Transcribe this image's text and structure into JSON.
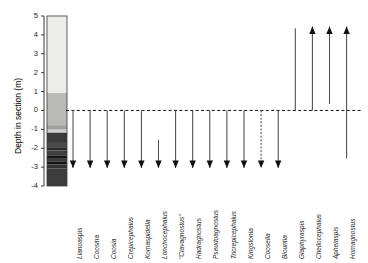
{
  "chart_data": {
    "type": "range-chart",
    "title": "",
    "ylabel": "Depth in section (m)",
    "xlabel": "",
    "ylim": [
      -4,
      5
    ],
    "yticks": [
      5,
      4,
      3,
      2,
      1,
      0,
      -1,
      -2,
      -3,
      -4
    ],
    "ytick_labels": [
      "5",
      "4",
      "3",
      "2",
      "1",
      "0",
      "-1",
      "-2",
      "-3",
      "-4"
    ],
    "datum_line": {
      "value": 0,
      "style": "dashed",
      "color": "#111111"
    },
    "grid": false,
    "legend": null,
    "lithology_column": {
      "x_range": [
        -4.1,
        5
      ],
      "bands": [
        {
          "top": 5.0,
          "bottom": 0.92,
          "color": "#ececea"
        },
        {
          "top": 0.92,
          "bottom": -0.78,
          "color": "#b9b9b7"
        },
        {
          "top": -0.78,
          "bottom": -1.02,
          "color": "#a0a09e"
        },
        {
          "top": -1.02,
          "bottom": -1.18,
          "color": "#cfcfcd"
        },
        {
          "top": -1.18,
          "bottom": -1.72,
          "color": "#3b3b3b"
        },
        {
          "top": -1.72,
          "bottom": -1.95,
          "color": "#4a4a4a"
        },
        {
          "top": -1.95,
          "bottom": -2.12,
          "color": "#2a2a2a"
        },
        {
          "top": -2.12,
          "bottom": -2.38,
          "color": "#3f3f3f"
        },
        {
          "top": -2.38,
          "bottom": -2.52,
          "color": "#161616"
        },
        {
          "top": -2.52,
          "bottom": -2.72,
          "color": "#3a3a3a"
        },
        {
          "top": -2.72,
          "bottom": -2.86,
          "color": "#141414"
        },
        {
          "top": -2.86,
          "bottom": -3.08,
          "color": "#333333"
        },
        {
          "top": -3.08,
          "bottom": -4.0,
          "color": "#3c3c3c"
        }
      ]
    },
    "categories": [
      "Llanoaspis",
      "Coosina",
      "Coosia",
      "Crepicephalus",
      "Komaspidella",
      "Lonchocephalus",
      "\"Clavagnostus\"",
      "Hadragnostus",
      "Pseudoagnostus",
      "Tricrepicephalus",
      "Kingstonia",
      "Coosella",
      "Blountia",
      "Glaphyraspis",
      "Cheilocephalus",
      "Aphelaspis",
      "Homagnostus"
    ],
    "ranges": [
      {
        "taxon": "Llanoaspis",
        "top": 0,
        "bottom": -3.05,
        "direction": "down",
        "arrowhead": true,
        "line_style": "solid"
      },
      {
        "taxon": "Coosina",
        "top": 0,
        "bottom": -3.05,
        "direction": "down",
        "arrowhead": true,
        "line_style": "solid"
      },
      {
        "taxon": "Coosia",
        "top": 0,
        "bottom": -3.05,
        "direction": "down",
        "arrowhead": true,
        "line_style": "solid"
      },
      {
        "taxon": "Crepicephalus",
        "top": 0,
        "bottom": -3.05,
        "direction": "down",
        "arrowhead": true,
        "line_style": "solid"
      },
      {
        "taxon": "Komaspidella",
        "top": 0,
        "bottom": -3.05,
        "direction": "down",
        "arrowhead": true,
        "line_style": "solid"
      },
      {
        "taxon": "Lonchocephalus",
        "top": -1.55,
        "bottom": -3.05,
        "direction": "down",
        "arrowhead": true,
        "line_style": "solid"
      },
      {
        "taxon": "\"Clavagnostus\"",
        "top": 0,
        "bottom": -3.05,
        "direction": "down",
        "arrowhead": true,
        "line_style": "solid"
      },
      {
        "taxon": "Hadragnostus",
        "top": 0,
        "bottom": -3.05,
        "direction": "down",
        "arrowhead": true,
        "line_style": "solid"
      },
      {
        "taxon": "Pseudoagnostus",
        "top": 0,
        "bottom": -3.05,
        "direction": "down",
        "arrowhead": true,
        "line_style": "solid"
      },
      {
        "taxon": "Tricrepicephalus",
        "top": 0,
        "bottom": -3.05,
        "direction": "down",
        "arrowhead": true,
        "line_style": "solid"
      },
      {
        "taxon": "Kingstonia",
        "top": 0,
        "bottom": -3.05,
        "direction": "down",
        "arrowhead": true,
        "line_style": "solid"
      },
      {
        "taxon": "Coosella",
        "top": 0,
        "bottom": -3.05,
        "direction": "down",
        "arrowhead": true,
        "line_style": "dashed"
      },
      {
        "taxon": "Blountia",
        "top": 0,
        "bottom": -3.05,
        "direction": "down",
        "arrowhead": true,
        "line_style": "solid"
      },
      {
        "taxon": "Glaphyraspis",
        "top": 4.35,
        "bottom": 0,
        "direction": "none",
        "arrowhead": false,
        "line_style": "solid"
      },
      {
        "taxon": "Cheilocephalus",
        "top": 4.45,
        "bottom": 0,
        "direction": "up",
        "arrowhead": true,
        "line_style": "solid"
      },
      {
        "taxon": "Aphelaspis",
        "top": 4.45,
        "bottom": 0.35,
        "direction": "up",
        "arrowhead": true,
        "line_style": "solid"
      },
      {
        "taxon": "Homagnostus",
        "top": 4.45,
        "bottom": -2.55,
        "direction": "up",
        "arrowhead": true,
        "line_style": "solid"
      }
    ]
  }
}
